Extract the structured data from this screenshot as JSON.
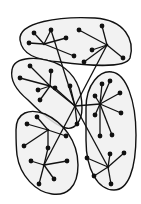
{
  "diagram": {
    "type": "clustered-network",
    "background": "#ffffff",
    "cluster_fill": "#f0f0f0",
    "stroke_color": "#111111",
    "node_color": "#111111",
    "clusters": [
      {
        "id": "top",
        "path": "M20,40 C18,22 60,16 95,18 C125,20 135,40 130,58 C126,68 90,66 60,62 C35,60 22,54 20,40 Z"
      },
      {
        "id": "left-middle",
        "path": "M12,70 C14,56 40,55 60,65 C75,74 82,90 82,108 C82,122 74,130 66,128 C55,126 40,112 28,100 C16,90 10,80 12,70 Z"
      },
      {
        "id": "bottom-left",
        "path": "M16,130 C16,112 30,108 45,114 C62,122 78,140 78,165 C78,188 66,196 52,194 C36,192 20,176 17,155 C16,146 16,138 16,130 Z"
      },
      {
        "id": "right",
        "path": "M86,108 C86,84 100,70 112,72 C126,74 136,100 136,135 C136,170 128,190 114,190 C98,190 86,170 86,140 Z"
      }
    ],
    "nodes": [
      {
        "id": "t1",
        "x": 34,
        "y": 33
      },
      {
        "id": "t2",
        "x": 51,
        "y": 30
      },
      {
        "id": "t3",
        "x": 29,
        "y": 43
      },
      {
        "id": "t4",
        "x": 66,
        "y": 38
      },
      {
        "id": "t5",
        "x": 74,
        "y": 56
      },
      {
        "id": "t6",
        "x": 79,
        "y": 30
      },
      {
        "id": "t7",
        "x": 102,
        "y": 26
      },
      {
        "id": "t8",
        "x": 92,
        "y": 50
      },
      {
        "id": "t9",
        "x": 84,
        "y": 62
      },
      {
        "id": "t10",
        "x": 123,
        "y": 58
      },
      {
        "id": "thub",
        "x": 107,
        "y": 45
      },
      {
        "id": "tc",
        "x": 44,
        "y": 44
      },
      {
        "id": "l1",
        "x": 30,
        "y": 66
      },
      {
        "id": "l2",
        "x": 51,
        "y": 71
      },
      {
        "id": "l3",
        "x": 20,
        "y": 78
      },
      {
        "id": "l4",
        "x": 38,
        "y": 90
      },
      {
        "id": "l5",
        "x": 55,
        "y": 88
      },
      {
        "id": "l6",
        "x": 40,
        "y": 100
      },
      {
        "id": "l7",
        "x": 70,
        "y": 86
      },
      {
        "id": "l8",
        "x": 77,
        "y": 124
      },
      {
        "id": "lc",
        "x": 50,
        "y": 86
      },
      {
        "id": "hub",
        "x": 75,
        "y": 106
      },
      {
        "id": "b1",
        "x": 27,
        "y": 124
      },
      {
        "id": "b2",
        "x": 37,
        "y": 117
      },
      {
        "id": "b3",
        "x": 24,
        "y": 146
      },
      {
        "id": "b4",
        "x": 66,
        "y": 136
      },
      {
        "id": "b5",
        "x": 48,
        "y": 148
      },
      {
        "id": "b6",
        "x": 31,
        "y": 161
      },
      {
        "id": "b7",
        "x": 67,
        "y": 161
      },
      {
        "id": "b8",
        "x": 39,
        "y": 184
      },
      {
        "id": "b9",
        "x": 54,
        "y": 179
      },
      {
        "id": "bc1",
        "x": 48,
        "y": 130
      },
      {
        "id": "bc2",
        "x": 44,
        "y": 165
      },
      {
        "id": "r1",
        "x": 102,
        "y": 84
      },
      {
        "id": "r2",
        "x": 110,
        "y": 81
      },
      {
        "id": "r3",
        "x": 95,
        "y": 96
      },
      {
        "id": "r4",
        "x": 120,
        "y": 93
      },
      {
        "id": "r5",
        "x": 121,
        "y": 113
      },
      {
        "id": "r6",
        "x": 95,
        "y": 115
      },
      {
        "id": "r7",
        "x": 100,
        "y": 136
      },
      {
        "id": "r8",
        "x": 112,
        "y": 135
      },
      {
        "id": "r9",
        "x": 87,
        "y": 158
      },
      {
        "id": "r10",
        "x": 110,
        "y": 154
      },
      {
        "id": "r11",
        "x": 124,
        "y": 153
      },
      {
        "id": "r12",
        "x": 94,
        "y": 176
      },
      {
        "id": "r13",
        "x": 111,
        "y": 184
      },
      {
        "id": "rc1",
        "x": 100,
        "y": 104
      },
      {
        "id": "rc2",
        "x": 108,
        "y": 167
      }
    ],
    "edges": [
      [
        "tc",
        "t1"
      ],
      [
        "tc",
        "t2"
      ],
      [
        "tc",
        "t3"
      ],
      [
        "tc",
        "t4"
      ],
      [
        "tc",
        "t5"
      ],
      [
        "thub",
        "t6"
      ],
      [
        "thub",
        "t7"
      ],
      [
        "thub",
        "t8"
      ],
      [
        "thub",
        "t9"
      ],
      [
        "thub",
        "t10"
      ],
      [
        "t2",
        "hub"
      ],
      [
        "thub",
        "hub"
      ],
      [
        "lc",
        "l1"
      ],
      [
        "lc",
        "l2"
      ],
      [
        "lc",
        "l3"
      ],
      [
        "lc",
        "l4"
      ],
      [
        "lc",
        "l5"
      ],
      [
        "lc",
        "l6"
      ],
      [
        "hub",
        "l7"
      ],
      [
        "hub",
        "l8"
      ],
      [
        "hub",
        "lc"
      ],
      [
        "hub",
        "l5"
      ],
      [
        "bc1",
        "b1"
      ],
      [
        "bc1",
        "b2"
      ],
      [
        "bc1",
        "b3"
      ],
      [
        "bc1",
        "b4"
      ],
      [
        "bc1",
        "b5"
      ],
      [
        "bc2",
        "b6"
      ],
      [
        "bc2",
        "b7"
      ],
      [
        "bc2",
        "b8"
      ],
      [
        "bc2",
        "b9"
      ],
      [
        "bc2",
        "b5"
      ],
      [
        "hub",
        "bc2"
      ],
      [
        "rc1",
        "r1"
      ],
      [
        "rc1",
        "r2"
      ],
      [
        "rc1",
        "r3"
      ],
      [
        "rc1",
        "r4"
      ],
      [
        "rc1",
        "r5"
      ],
      [
        "rc1",
        "r6"
      ],
      [
        "rc1",
        "r7"
      ],
      [
        "rc1",
        "r8"
      ],
      [
        "rc2",
        "r9"
      ],
      [
        "rc2",
        "r10"
      ],
      [
        "rc2",
        "r11"
      ],
      [
        "rc2",
        "r12"
      ],
      [
        "rc2",
        "r13"
      ],
      [
        "hub",
        "rc1"
      ],
      [
        "hub",
        "rc2"
      ]
    ]
  }
}
